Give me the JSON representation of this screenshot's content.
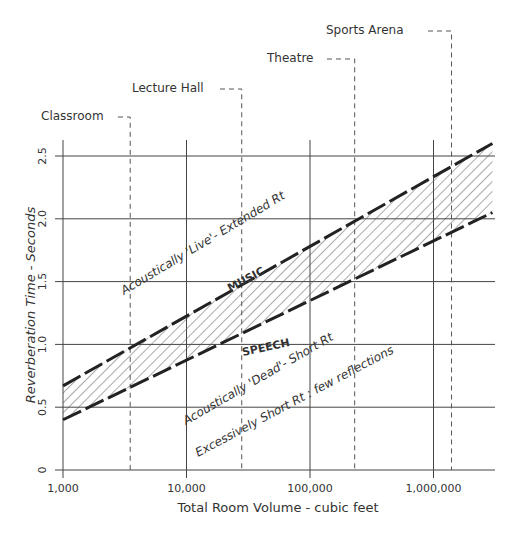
{
  "chart_data": {
    "type": "area",
    "title": "",
    "xlabel": "Total Room Volume - cubic feet",
    "ylabel": "Reverberation Time - Seconds",
    "x_scale": "log",
    "xlim": [
      1000,
      3000000
    ],
    "ylim": [
      0,
      2.5
    ],
    "x_ticks": [
      1000,
      10000,
      100000,
      1000000
    ],
    "x_tick_labels": [
      "1,000",
      "10,000",
      "100,000",
      "1,000,000"
    ],
    "y_ticks": [
      0,
      0.5,
      1.0,
      1.5,
      2.0,
      2.5
    ],
    "y_tick_labels": [
      "0",
      "0.5",
      "1.0",
      "1.5",
      "2.0",
      "2.5"
    ],
    "grid": true,
    "series": [
      {
        "name": "MUSIC",
        "style": "dashed-upper-boundary",
        "x": [
          1000,
          3000000
        ],
        "values": [
          0.67,
          2.6
        ]
      },
      {
        "name": "SPEECH",
        "style": "dashed-lower-boundary",
        "x": [
          1000,
          3000000
        ],
        "values": [
          0.4,
          2.05
        ]
      }
    ],
    "band": {
      "fill": "hatched",
      "between": [
        "SPEECH",
        "MUSIC"
      ]
    },
    "reference_lines": [
      {
        "label": "Classroom",
        "x": 3500
      },
      {
        "label": "Lecture Hall",
        "x": 28000
      },
      {
        "label": "Theatre",
        "x": 230000
      },
      {
        "label": "Sports Arena",
        "x": 1400000
      }
    ],
    "annotations": [
      "Acoustically 'Live' - Extended Rt",
      "MUSIC",
      "SPEECH",
      "Acoustically 'Dead' - Short Rt",
      "Excessively Short Rt : few reflections"
    ]
  },
  "labels": {
    "xlabel": "Total Room Volume - cubic feet",
    "ylabel": "Reverberation Time - Seconds",
    "music": "MUSIC",
    "speech": "SPEECH",
    "live": "Acoustically 'Live'- Extended Rt",
    "dead": "Acoustically 'Dead'- Short Rt",
    "excessive": "Excessively Short Rt : few reflections",
    "classroom": "Classroom",
    "lecture_hall": "Lecture Hall",
    "theatre": "Theatre",
    "sports_arena": "Sports Arena"
  },
  "colors": {
    "ink": "#222222",
    "grid": "#444444",
    "background": "#ffffff"
  }
}
